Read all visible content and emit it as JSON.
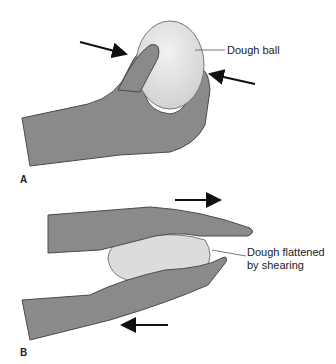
{
  "figure": {
    "panels": [
      {
        "id": "A",
        "label": "A",
        "annotation": "Dough ball",
        "arrows": [
          "pressing-right",
          "pressing-left"
        ]
      },
      {
        "id": "B",
        "label": "B",
        "annotation_line1": "Dough flattened",
        "annotation_line2": "by shearing",
        "arrows": [
          "top-right",
          "bottom-left"
        ]
      }
    ],
    "colors": {
      "skin": "#8a8a8a",
      "skin_outline": "#4a4a4a",
      "dough": "#dcdcdc",
      "arrow": "#111111"
    }
  }
}
